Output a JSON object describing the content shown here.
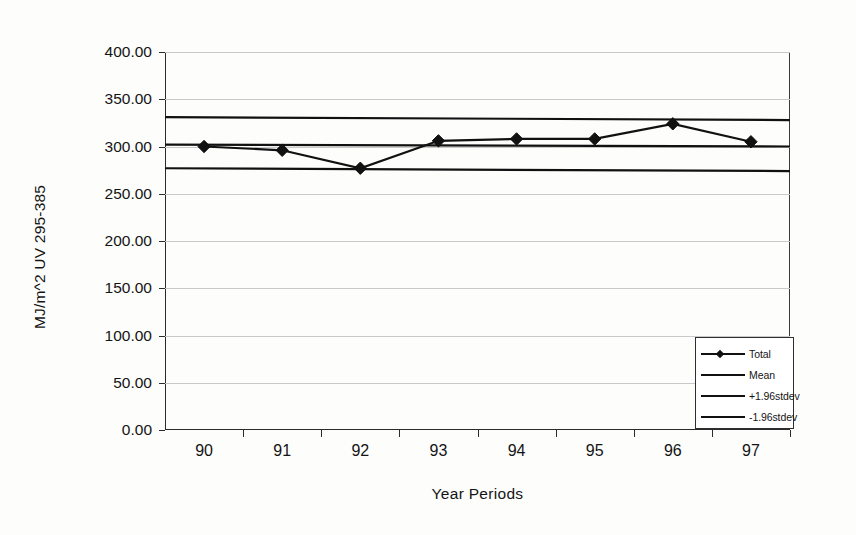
{
  "chart_data": {
    "type": "line",
    "title": "",
    "xlabel": "Year Periods",
    "ylabel": "MJ/m^2 UV 295-385",
    "categories": [
      "90",
      "91",
      "92",
      "93",
      "94",
      "95",
      "96",
      "97"
    ],
    "ylim": [
      0,
      400
    ],
    "ytick_labels": [
      "0.00",
      "50.00",
      "100.00",
      "150.00",
      "200.00",
      "250.00",
      "300.00",
      "350.00",
      "400.00"
    ],
    "ytick_values": [
      0,
      50,
      100,
      150,
      200,
      250,
      300,
      350,
      400
    ],
    "grid": true,
    "legend_position": "bottom-right",
    "series": [
      {
        "name": "Total",
        "type": "line-marker",
        "marker": "diamond",
        "color": "#111111",
        "values": [
          300.0,
          296.0,
          277.0,
          306.0,
          308.0,
          308.0,
          324.0,
          305.0
        ]
      },
      {
        "name": "Mean",
        "type": "reference-line",
        "color": "#111111",
        "value": 301.0,
        "value_left": 302.0,
        "value_right": 300.0
      },
      {
        "name": "+1.96stdev",
        "type": "reference-line",
        "color": "#111111",
        "value": 330.0,
        "value_left": 331.0,
        "value_right": 328.0
      },
      {
        "name": "-1.96stdev",
        "type": "reference-line",
        "color": "#111111",
        "value": 276.0,
        "value_left": 277.0,
        "value_right": 274.0
      }
    ]
  },
  "legend": {
    "items": [
      {
        "label": "Total",
        "marker": "diamond"
      },
      {
        "label": "Mean",
        "marker": "none"
      },
      {
        "label": "+1.96stdev",
        "marker": "none"
      },
      {
        "label": "-1.96stdev",
        "marker": "none"
      }
    ]
  },
  "colors": {
    "ink": "#111111",
    "axis": "#2b2b2b",
    "grid": "#c9c9c9",
    "background": "#fdfdfc"
  }
}
